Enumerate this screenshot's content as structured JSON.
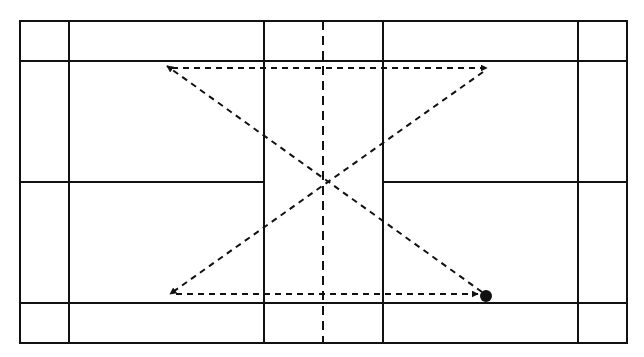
{
  "diagram": {
    "type": "badminton-court-movement-pattern",
    "canvas": {
      "width": 644,
      "height": 357,
      "background": "#ffffff"
    },
    "colors": {
      "line": "#111111"
    },
    "court": {
      "outer": {
        "x1": 20,
        "y1": 21,
        "x2": 627,
        "y2": 343
      },
      "vertical_lines": [
        69,
        264,
        383,
        578
      ],
      "horizontal_lines": [
        61,
        303
      ],
      "center_line_segments": [
        {
          "x1": 20,
          "y1": 182,
          "x2": 264,
          "y2": 182
        },
        {
          "x1": 383,
          "y1": 182,
          "x2": 627,
          "y2": 182
        }
      ],
      "net_dashed": {
        "x": 323,
        "y1": 21,
        "y2": 343
      }
    },
    "start_point": {
      "label": "player-position",
      "cx": 486,
      "cy": 296,
      "r": 6
    },
    "movement_path": [
      {
        "step": 1,
        "from": [
          482,
          292
        ],
        "to": [
          167,
          66
        ],
        "direction": "diagonal-up-left"
      },
      {
        "step": 2,
        "from": [
          172,
          68
        ],
        "to": [
          487,
          68
        ],
        "direction": "right"
      },
      {
        "step": 3,
        "from": [
          483,
          72
        ],
        "to": [
          170,
          294
        ],
        "direction": "diagonal-down-left"
      },
      {
        "step": 4,
        "from": [
          176,
          294
        ],
        "to": [
          478,
          294
        ],
        "direction": "right"
      }
    ]
  }
}
